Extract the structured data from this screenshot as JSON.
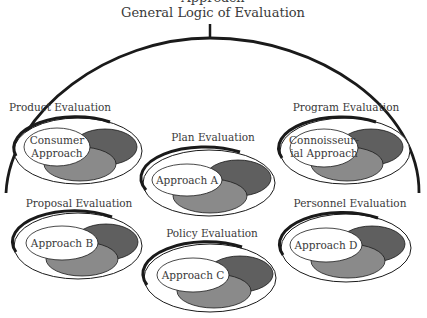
{
  "diagram": {
    "top_cut_text": "Approach",
    "title": "General Logic of Evaluation",
    "colors": {
      "line": "#1a1a1a",
      "dark_oval": "#5f5f5f",
      "medium_oval": "#8a8a8a",
      "white_oval": "#ffffff",
      "text": "#3a3a3a"
    },
    "groups": [
      {
        "id": "product",
        "label": "Product Evaluation",
        "approach_line1": "Consumer",
        "approach_line2": "Approach"
      },
      {
        "id": "plan",
        "label": "Plan Evaluation",
        "approach_line1": "Approach A",
        "approach_line2": ""
      },
      {
        "id": "program",
        "label": "Program Evaluation",
        "approach_line1": "Connoisseur-",
        "approach_line2": "ial Approach"
      },
      {
        "id": "proposal",
        "label": "Proposal Evaluation",
        "approach_line1": "Approach B",
        "approach_line2": ""
      },
      {
        "id": "policy",
        "label": "Policy Evaluation",
        "approach_line1": "Approach C",
        "approach_line2": ""
      },
      {
        "id": "personnel",
        "label": "Personnel Evaluation",
        "approach_line1": "Approach D",
        "approach_line2": ""
      }
    ]
  }
}
